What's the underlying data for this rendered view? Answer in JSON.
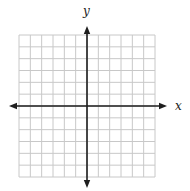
{
  "diagram": {
    "type": "coordinate-plane",
    "x_axis_label": "x",
    "y_axis_label": "y",
    "grid": {
      "columns": 12,
      "rows": 12,
      "left": 19,
      "top": 35,
      "right": 155,
      "bottom": 177
    },
    "origin": {
      "x": 87,
      "y": 106
    },
    "axis_extent": {
      "x_min_px": 9,
      "x_max_px": 167,
      "y_min_px": 26,
      "y_max_px": 188
    },
    "colors": {
      "grid": "#c8c8c8",
      "axis": "#1e1e1e",
      "background": "#ffffff"
    }
  }
}
